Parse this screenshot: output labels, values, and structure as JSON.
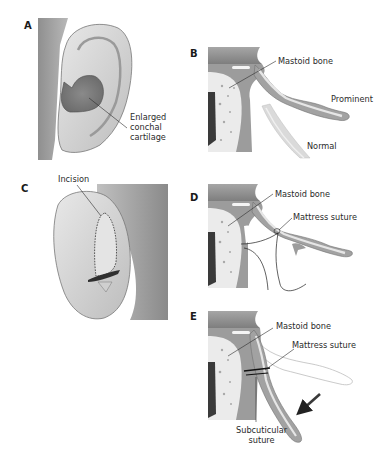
{
  "figure": {
    "panels": [
      {
        "id": "A",
        "label": "A",
        "callouts": [
          "Enlarged",
          "conchal",
          "cartilage"
        ]
      },
      {
        "id": "B",
        "label": "B",
        "callouts": [
          "Mastoid bone",
          "Prominent",
          "Normal"
        ]
      },
      {
        "id": "C",
        "label": "C",
        "callouts": [
          "Incision"
        ]
      },
      {
        "id": "D",
        "label": "D",
        "callouts": [
          "Mastoid bone",
          "Mattress suture"
        ]
      },
      {
        "id": "E",
        "label": "E",
        "callouts": [
          "Mastoid bone",
          "Mattress suture",
          "Subcuticular",
          "suture"
        ]
      }
    ]
  },
  "colors": {
    "skin_light": "#e3e3e3",
    "skin_mid": "#c4c4c4",
    "skin_dark": "#8e8e8e",
    "cartilage_fill": "#d8d8d8",
    "cartilage_outline": "#6e6e6e",
    "bone_fill": "#ececec",
    "bone_dark": "#3c3c3c",
    "text": "#2b2b2b"
  }
}
